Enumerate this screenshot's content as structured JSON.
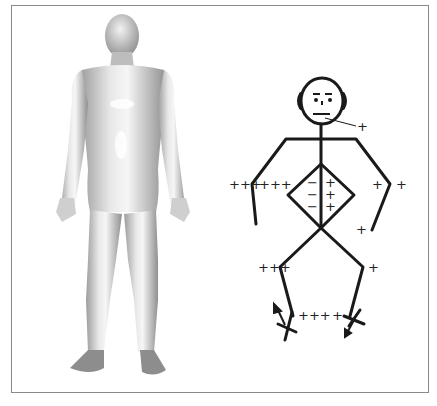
{
  "figure": {
    "left_panel": {
      "description": "3D rendered human body mesh, front view, standing, arms at sides",
      "shading_color": "#d6d6d6"
    },
    "right_panel": {
      "description": "Stick figure annotated with joint rotation signs",
      "line_color": "#1a1a1a",
      "labels": {
        "chin": "+",
        "left_shoulder_out": "+++",
        "left_elbow_in": "+++",
        "right_elbow_in": "+",
        "right_shoulder_out": "+",
        "torso_left": [
          "−",
          "−",
          "−"
        ],
        "torso_right": [
          "+",
          "+",
          "+"
        ],
        "right_wrist": "+",
        "left_knee": "+++",
        "right_knee": "+",
        "left_ankle": "+++",
        "right_ankle": "+"
      }
    }
  }
}
